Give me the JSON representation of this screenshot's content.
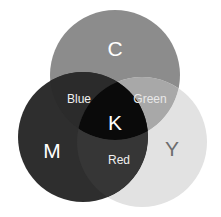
{
  "diagram": {
    "background_color": "#ffffff",
    "canvas": {
      "width": 221,
      "height": 217
    },
    "circles": [
      {
        "id": "cyan",
        "label": "C",
        "name": "Cyan",
        "cx": 115,
        "cy": 75,
        "r": 65,
        "fill": "#8c8c8c",
        "label_x": 115,
        "label_y": 50,
        "label_color": "#ffffff"
      },
      {
        "id": "magenta",
        "label": "M",
        "name": "Magenta",
        "cx": 83,
        "cy": 137,
        "r": 65,
        "fill": "#2e2e2e",
        "label_x": 52,
        "label_y": 152,
        "label_color": "#ffffff"
      },
      {
        "id": "yellow",
        "label": "Y",
        "name": "Yellow",
        "cx": 142,
        "cy": 142,
        "r": 65,
        "fill": "#e2e2e2",
        "label_x": 172,
        "label_y": 150,
        "label_color": "#6e6e6e"
      }
    ],
    "overlaps": [
      {
        "id": "blue",
        "label": "Blue",
        "description": "Cyan and Magenta overlap",
        "fill": "#2b2b2b",
        "label_x": 79,
        "label_y": 100,
        "label_color": "#f0f0f0"
      },
      {
        "id": "green",
        "label": "Green",
        "description": "Cyan and Yellow overlap",
        "fill": "#a8a8a8",
        "label_x": 150,
        "label_y": 100,
        "label_color": "#e8e8e8"
      },
      {
        "id": "red",
        "label": "Red",
        "description": "Magenta and Yellow overlap",
        "fill": "#363636",
        "label_x": 119,
        "label_y": 161,
        "label_color": "#f0f0f0"
      },
      {
        "id": "key",
        "label": "K",
        "description": "Cyan, Magenta and Yellow overlap",
        "fill": "#0a0a0a",
        "label_x": 115,
        "label_y": 124,
        "label_color": "#ffffff"
      }
    ]
  }
}
